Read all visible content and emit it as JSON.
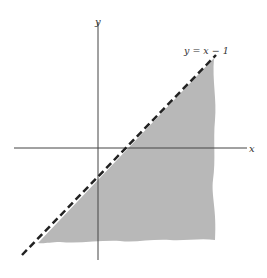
{
  "diagram": {
    "type": "inequality-region",
    "line_label": "y = x − 1",
    "x_axis_label": "x",
    "y_axis_label": "y",
    "line": {
      "equation": "y = x - 1",
      "style": "dashed",
      "color": "#222222"
    },
    "region": {
      "description": "shaded region below the line y = x - 1",
      "fill": "#b8b8b8"
    },
    "axes_color": "#444444"
  }
}
